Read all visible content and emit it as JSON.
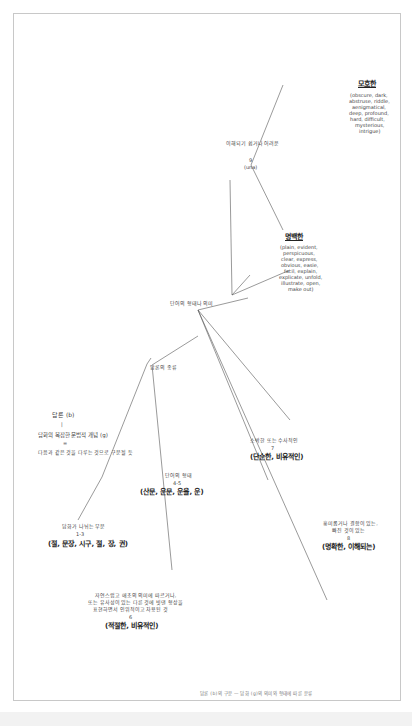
{
  "diagram": {
    "root": {
      "title": "담론 (b)",
      "connector": "|",
      "definition": "담화의 복잡한 문법적 개념 (g)",
      "equals": "=",
      "note": "다음과 같은 것을 다루는 것으로 구분될 듯"
    },
    "branch_parts": {
      "label": "담화가 나뉘는 부분",
      "number": "1-3",
      "terms": "(절, 문장, 시구, 절, 장, 권)"
    },
    "branch_types": {
      "label": "담론의 종류",
      "form": {
        "label": "단어의 형태",
        "number": "4-5",
        "terms": "(산문, 운문, 운율, 운)"
      }
    },
    "branch_meaning": {
      "label": "단어의 형태나 의미",
      "literal": {
        "desc1": "자연스럽고 애초의 의미에 따르거나,",
        "desc2": "또는 유사성이 있는 다른 것에 빗댄 형상을",
        "desc3": "표현하면서 인위적이고 차용된 것",
        "number": "6",
        "terms": "(적절한, 비유적인)"
      },
      "simple": {
        "desc": "소박한 또는 수사적인",
        "number": "7",
        "terms": "(단순한, 비유적인)"
      },
      "clear_sense": {
        "desc1": "흥미롭거나 결함이 있는,",
        "desc2": "빠진 것이 있는",
        "number": "8",
        "terms": "(명확한, 이해되는)"
      },
      "understanding": {
        "label": "이해되기 쉽거나 어려운",
        "number": "9",
        "sub": "(una)",
        "clear": {
          "title": "명백한",
          "words": [
            "(plain, evident,",
            "perspicuous,",
            "clear, express,",
            "obvious, easie,",
            "facil, explain,",
            "explicate, unfold,",
            "illustrate, open,",
            "make out)"
          ]
        },
        "obscure": {
          "title": "모호한",
          "words": [
            "(obscure, dark,",
            "abstruse, riddle,",
            "aenigmatical,",
            "deep, profound,",
            "hard, difficult,",
            "mysterious,",
            "intrigue)"
          ]
        }
      }
    },
    "caption": "담론 (b)의 구분 — 담화 (g)의 의미와 형태에 따른 분류"
  },
  "colors": {
    "line": "#555555",
    "border": "#c8c8c8",
    "text": "#333333"
  }
}
